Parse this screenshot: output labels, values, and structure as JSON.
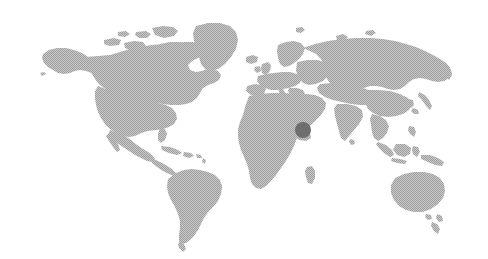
{
  "map": {
    "type": "world-map",
    "projection": "equirectangular",
    "width": 488,
    "height": 259,
    "background_color": "#ffffff",
    "land_color": "#b4b4b4",
    "land_texture": "halftone-dither",
    "ocean_color": "#ffffff",
    "title": "",
    "regions_visible": [
      "North America",
      "South America",
      "Greenland",
      "Europe",
      "Africa",
      "Asia",
      "Australia",
      "New Zealand",
      "Japan",
      "Indonesia",
      "British Isles",
      "Madagascar"
    ]
  },
  "markers": [
    {
      "name": "United Arab Emirates",
      "region": "Middle East",
      "x": 303,
      "y": 130,
      "radius": 8,
      "color": "#6e6e6e",
      "label": ""
    }
  ],
  "legend": {
    "visible": false,
    "entries": []
  },
  "controls": {
    "visible": false,
    "zoom_in_label": "",
    "zoom_out_label": ""
  }
}
